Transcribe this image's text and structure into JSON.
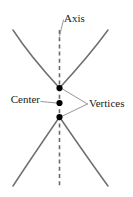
{
  "figure": {
    "kind": "hyperbola-diagram",
    "width": 133,
    "height": 197,
    "background_color": "#ffffff"
  },
  "labels": {
    "axis": "Axis",
    "center": "Center",
    "vertices": "Vertices"
  },
  "colors": {
    "curve": "#6f6f6f",
    "axis": "#6b6b6b",
    "leader": "#8a8a8a",
    "point": "#000000",
    "text": "#1a1a1a"
  },
  "geometry": {
    "axis_x": 59.5,
    "axis_top_y": 30,
    "axis_bottom_y": 188,
    "center_point": {
      "x": 59.5,
      "y": 103
    },
    "upper_vertex": {
      "x": 59.5,
      "y": 88
    },
    "lower_vertex": {
      "x": 59.5,
      "y": 117
    },
    "dot_radius": 3.1,
    "upper_branch": "M 13 30 Q 30 56 59.5 88 Q 89 56 108 30",
    "lower_branch": "M 13 186 Q 30 160 59.5 117 Q 89 160 108 186",
    "leader_axis": "M 63.5 20 L 59.5 36",
    "leader_center": "M 41 101.5 L 56.5 103",
    "leader_vertices_upper": "M 87.5 104 L 62.5 89",
    "leader_vertices_lower": "M 87.5 104 L 62.5 116"
  },
  "text_positions": {
    "axis": {
      "x": 64,
      "y": 19
    },
    "center": {
      "x": 40,
      "y": 100
    },
    "vertices": {
      "x": 89,
      "y": 104
    }
  }
}
